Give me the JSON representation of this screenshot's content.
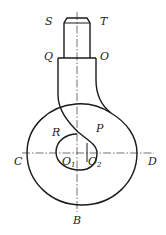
{
  "diagram": {
    "type": "engineering drawing — hook with shank",
    "labels": {
      "S": "S",
      "T": "T",
      "Q": "Q",
      "O": "O",
      "R": "R",
      "P": "P",
      "C": "C",
      "D": "D",
      "O1": "O",
      "O1_sub": "1",
      "O2": "O",
      "O2_sub": "2",
      "B": "B"
    },
    "colors": {
      "line": "#1a1a1a",
      "background": "#ffffff"
    }
  }
}
